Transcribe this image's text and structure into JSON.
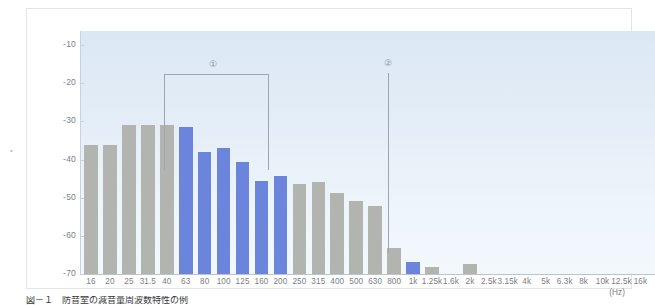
{
  "chart_data": {
    "type": "bar",
    "title": "",
    "subtitle": "",
    "xlabel": "(Hz)",
    "ylabel": "",
    "ylim": [
      -70,
      -5
    ],
    "baseline": -70,
    "grid": false,
    "legend_position": "none",
    "categories": [
      "16",
      "20",
      "25",
      "31.5",
      "40",
      "63",
      "80",
      "100",
      "125",
      "160",
      "200",
      "250",
      "315",
      "400",
      "500",
      "630",
      "800",
      "1k",
      "1.25k",
      "1.6k",
      "2k",
      "2.5k",
      "3.15k",
      "4k",
      "5k",
      "6.3k",
      "8k",
      "10k",
      "12.5k",
      "16k"
    ],
    "values": [
      -36.2,
      -36.2,
      -31.0,
      -31.0,
      -31.0,
      -31.5,
      -38.0,
      -37.0,
      -40.7,
      -45.7,
      -44.4,
      -46.5,
      -46.0,
      -48.8,
      -51.0,
      -52.2,
      -63.2,
      -66.9,
      -68.2,
      -70.0,
      -67.4,
      -70.0,
      -70.0,
      -70.0,
      -70.0,
      -70.0,
      -70.0,
      -70.0,
      -70.0,
      -70.0
    ],
    "bar_colors": [
      "gray",
      "gray",
      "gray",
      "gray",
      "gray",
      "blue",
      "blue",
      "blue",
      "blue",
      "blue",
      "blue",
      "gray",
      "gray",
      "gray",
      "gray",
      "gray",
      "gray",
      "blue",
      "gray",
      "gray",
      "gray",
      "gray",
      "gray",
      "gray",
      "gray",
      "gray",
      "gray",
      "gray",
      "gray",
      "gray"
    ],
    "y_ticks": [
      -10,
      -20,
      -30,
      -40,
      -50,
      -60,
      -70
    ],
    "y_tick_labels": [
      "-10",
      "-20",
      "-30",
      "-40",
      "-50",
      "-60",
      "-70"
    ],
    "colors": {
      "gray_bar": "#b2b4af",
      "blue_bar": "#6b85dc",
      "plot_background_top": "#dbe8f4",
      "plot_background_bottom": "#f3f8fc",
      "axis": "#c8d2da",
      "text": "#7a8086",
      "annotation": "#9aa6b2"
    },
    "annotations": [
      {
        "label": "①",
        "name": "annotation-bracket-1",
        "kind": "bracket",
        "span_start_category": "63",
        "span_end_category": "200",
        "marker_x_px": 212,
        "marker_y_px": 59,
        "bracket_left_px": 163,
        "bracket_right_px": 268,
        "bracket_top_px": 73,
        "bracket_height_px": 96
      },
      {
        "label": "②",
        "name": "annotation-pointer-2",
        "kind": "pointer",
        "target_category": "1k",
        "marker_x_px": 387,
        "marker_y_px": 58,
        "line_top_px": 72,
        "line_bottom_px": 252
      }
    ]
  },
  "axis": {
    "unit_label": "(Hz)"
  },
  "caption": {
    "text": "図－１　防音室の減音量周波数特性の例"
  },
  "side": {
    "mark": "•"
  }
}
